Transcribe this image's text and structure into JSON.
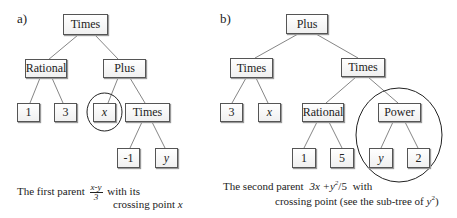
{
  "panel_a": {
    "label": "a)",
    "nodes": {
      "root": "Times",
      "rational": "Rational",
      "plus": "Plus",
      "one": "1",
      "three": "3",
      "x": "x",
      "times_inner": "Times",
      "neg_one": "-1",
      "y": "y"
    },
    "caption": {
      "prefix": "The first parent",
      "frac_num": "x-y",
      "frac_den": "3",
      "suffix": "with its",
      "line2_prefix": "crossing point",
      "line2_var": "x"
    }
  },
  "panel_b": {
    "label": "b)",
    "nodes": {
      "root": "Plus",
      "times_left": "Times",
      "times_right": "Times",
      "three": "3",
      "x": "x",
      "rational": "Rational",
      "power": "Power",
      "one": "1",
      "five": "5",
      "y": "y",
      "two": "2"
    },
    "caption": {
      "prefix": "The second parent",
      "expr": "3x +y",
      "expr_sup": "2",
      "expr_tail": "/5",
      "suffix": "with",
      "line2": "crossing point (see the sub-tree of",
      "line2_var": "y",
      "line2_sup": "2",
      "line2_close": ")"
    }
  }
}
